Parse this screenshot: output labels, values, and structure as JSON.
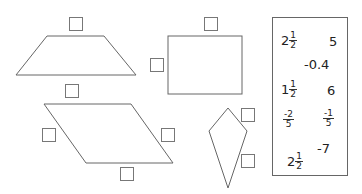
{
  "shapes": [
    {
      "name": "trapezoid",
      "answer_boxes": 2
    },
    {
      "name": "rectangle",
      "answer_boxes": 2
    },
    {
      "name": "parallelogram",
      "answer_boxes": 3
    },
    {
      "name": "kite",
      "answer_boxes": 2
    }
  ],
  "numbers": {
    "n1": {
      "whole": "2",
      "num": "1",
      "den": "2"
    },
    "n2": "5",
    "n3": "-0.4",
    "n4": {
      "whole": "1",
      "num": "1",
      "den": "2"
    },
    "n5": "6",
    "n6": {
      "num": "-2",
      "den": "5"
    },
    "n7": {
      "num": "-1",
      "den": "5"
    },
    "n8": {
      "whole": "2",
      "num": "1",
      "den": "2"
    },
    "n9": "-7"
  }
}
